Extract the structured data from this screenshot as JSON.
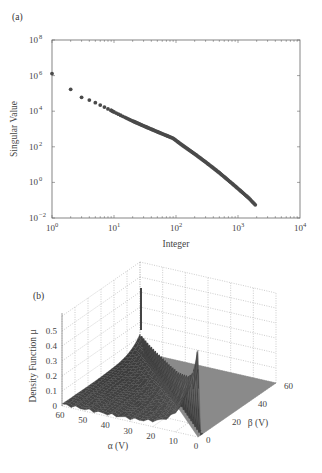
{
  "chart_data": [
    {
      "panel_label": "(a)",
      "type": "scatter",
      "title": "",
      "xlabel": "Integer",
      "ylabel": "Singular Value",
      "xscale": "log",
      "yscale": "log",
      "xlim": [
        1,
        10000
      ],
      "ylim": [
        0.01,
        100000000
      ],
      "x_tick_labels": [
        {
          "base": "10",
          "exp": "0",
          "value": 1
        },
        {
          "base": "10",
          "exp": "1",
          "value": 10
        },
        {
          "base": "10",
          "exp": "2",
          "value": 100
        },
        {
          "base": "10",
          "exp": "3",
          "value": 1000
        },
        {
          "base": "10",
          "exp": "4",
          "value": 10000
        }
      ],
      "y_tick_labels": [
        {
          "base": "10",
          "exp": "−2",
          "value": 0.01
        },
        {
          "base": "10",
          "exp": "0",
          "value": 1
        },
        {
          "base": "10",
          "exp": "2",
          "value": 100
        },
        {
          "base": "10",
          "exp": "4",
          "value": 10000
        },
        {
          "base": "10",
          "exp": "6",
          "value": 1000000
        },
        {
          "base": "10",
          "exp": "8",
          "value": 100000000
        }
      ],
      "grid": false,
      "marker_color": "#4a4a4a",
      "series": [
        {
          "name": "singular values",
          "points": [
            [
              1,
              1300000
            ],
            [
              2,
              170000
            ],
            [
              3,
              60000
            ],
            [
              4,
              42000
            ],
            [
              5,
              30000
            ],
            [
              6,
              22000
            ],
            [
              7,
              17000
            ],
            [
              8,
              13500
            ],
            [
              9,
              11000
            ],
            [
              10,
              9000
            ],
            [
              15,
              4500
            ],
            [
              20,
              2800
            ],
            [
              30,
              1500
            ],
            [
              50,
              700
            ],
            [
              70,
              430
            ],
            [
              90,
              300
            ],
            [
              120,
              140
            ],
            [
              200,
              40
            ],
            [
              300,
              14
            ],
            [
              500,
              3.5
            ],
            [
              700,
              1.3
            ],
            [
              1000,
              0.45
            ],
            [
              1500,
              0.13
            ],
            [
              1900,
              0.055
            ]
          ]
        }
      ]
    },
    {
      "panel_label": "(b)",
      "type": "surface3d",
      "title": "",
      "xlabel": "α (V)",
      "ylabel": "β (V)",
      "zlabel": "Density Function μ",
      "alpha_range": [
        0,
        60
      ],
      "beta_range": [
        0,
        60
      ],
      "zlim": [
        0,
        0.5
      ],
      "alpha_ticks": [
        "60",
        "50",
        "40",
        "30",
        "20",
        "10",
        "0"
      ],
      "beta_ticks": [
        "0",
        "20",
        "40",
        "60"
      ],
      "z_ticks": [
        "0",
        "0.1",
        "0.2",
        "0.3",
        "0.4",
        "0.5"
      ],
      "grid": true,
      "description": "Surface nonzero only for α ≥ β (triangle region); sharp peak ≈0.55 near α=β=0 decaying along α=β diagonal; ridged rows near base ≈0.1–0.2; region β > α is flat zero.",
      "peak": {
        "alpha": 0,
        "beta": 0,
        "value": 0.56
      },
      "diagonal_profile": [
        [
          0,
          0.56
        ],
        [
          2,
          0.45
        ],
        [
          5,
          0.36
        ],
        [
          10,
          0.29
        ],
        [
          20,
          0.22
        ],
        [
          30,
          0.18
        ],
        [
          40,
          0.15
        ],
        [
          50,
          0.12
        ],
        [
          60,
          0.1
        ]
      ],
      "surface_color": "#555555"
    }
  ]
}
